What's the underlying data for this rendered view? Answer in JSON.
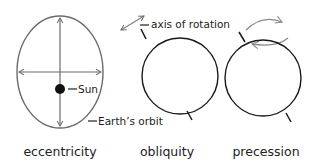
{
  "panels": [
    {
      "id": "eccentricity",
      "caption": "eccentricity",
      "labels": {
        "sun": "Sun",
        "orbit": "Earth’s orbit"
      }
    },
    {
      "id": "obliquity",
      "caption": "obliquity",
      "labels": {
        "axis": "axis of rotation"
      }
    },
    {
      "id": "precession",
      "caption": "precession",
      "labels": {}
    }
  ],
  "colors": {
    "orbit_stroke": "#6b6b6b",
    "earth_stroke": "#1a1a1a",
    "arrow_stroke": "#808080",
    "sun_fill": "#111111",
    "text": "#222222"
  }
}
